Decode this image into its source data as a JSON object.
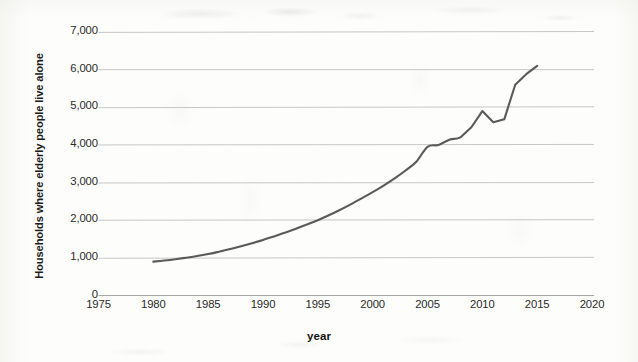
{
  "chart_data": {
    "type": "line",
    "title": "",
    "xlabel": "year",
    "ylabel": "Households where elderly people live alone",
    "xlim": [
      1975,
      2020
    ],
    "ylim": [
      0,
      7000
    ],
    "grid": true,
    "legend": false,
    "line_color": "#5a5a5a",
    "x_ticks": [
      1975,
      1980,
      1985,
      1990,
      1995,
      2000,
      2005,
      2010,
      2015,
      2020
    ],
    "x_tick_labels": [
      "1975",
      "1980",
      "1985",
      "1990",
      "1995",
      "2000",
      "2005",
      "2010",
      "2015",
      "2020"
    ],
    "y_ticks": [
      0,
      1000,
      2000,
      3000,
      4000,
      5000,
      6000,
      7000
    ],
    "y_tick_labels": [
      "0",
      "1,000",
      "2,000",
      "3,000",
      "4,000",
      "5,000",
      "6,000",
      "7,000"
    ],
    "series": [
      {
        "name": "Households where elderly people live alone",
        "x": [
          1980,
          1981,
          1982,
          1983,
          1984,
          1985,
          1986,
          1987,
          1988,
          1989,
          1990,
          1991,
          1992,
          1993,
          1994,
          1995,
          1996,
          1997,
          1998,
          1999,
          2000,
          2001,
          2002,
          2003,
          2004,
          2005,
          2006,
          2007,
          2008,
          2009,
          2010,
          2011,
          2012,
          2013,
          2014,
          2015
        ],
        "values": [
          900,
          930,
          965,
          1005,
          1050,
          1100,
          1165,
          1235,
          1310,
          1390,
          1475,
          1570,
          1670,
          1775,
          1885,
          2000,
          2130,
          2270,
          2420,
          2580,
          2745,
          2920,
          3110,
          3320,
          3560,
          3950,
          4000,
          4140,
          4200,
          4470,
          4900,
          4600,
          4680,
          5600,
          5880,
          6100
        ]
      }
    ]
  }
}
